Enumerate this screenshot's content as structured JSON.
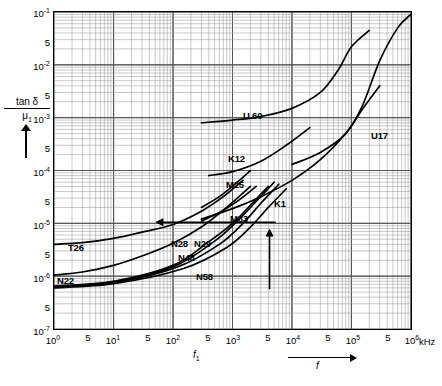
{
  "chart_data": {
    "type": "line",
    "title": "",
    "xlabel": "f",
    "xunit": "kHz",
    "ylabel": "tan δ / μ1",
    "x_axis": {
      "scale": "log",
      "min": 1,
      "max": 1000000,
      "decades": 6,
      "tick_labels": [
        "10",
        "5",
        "10",
        "5",
        "10",
        "5",
        "10",
        "5",
        "10",
        "5",
        "10",
        "5",
        "10"
      ],
      "major_labels": [
        "10^0",
        "10^1",
        "10^2",
        "10^3",
        "10^4",
        "10^5",
        "10^6"
      ],
      "minor_label": "5",
      "grid": true
    },
    "y_axis": {
      "scale": "log",
      "min": 1e-07,
      "max": 0.1,
      "decades": 6,
      "major_labels": [
        "10^-1",
        "10^-2",
        "10^-3",
        "10^-4",
        "10^-5",
        "10^-6",
        "10^-7"
      ],
      "minor_label": "5",
      "grid": true
    },
    "legend_position": "inline-annotations",
    "series": [
      {
        "name": "U60",
        "label": "U 60",
        "points": [
          [
            300,
            0.0008
          ],
          [
            1000,
            0.0009
          ],
          [
            3000,
            0.00105
          ],
          [
            10000,
            0.0015
          ],
          [
            30000,
            0.003
          ],
          [
            60000,
            0.008
          ],
          [
            100000,
            0.022
          ],
          [
            200000,
            0.045
          ]
        ]
      },
      {
        "name": "U17",
        "label": "U17",
        "points": [
          [
            10000,
            0.00013
          ],
          [
            30000,
            0.00022
          ],
          [
            80000,
            0.0005
          ],
          [
            150000,
            0.0016
          ],
          [
            300000,
            0.012
          ],
          [
            600000,
            0.05
          ],
          [
            1000000,
            0.09
          ]
        ]
      },
      {
        "name": "K12",
        "label": "K12",
        "points": [
          [
            400,
            8e-05
          ],
          [
            1000,
            9.5e-05
          ],
          [
            3000,
            0.00015
          ],
          [
            8000,
            0.0003
          ],
          [
            20000,
            0.00065
          ]
        ]
      },
      {
        "name": "M25",
        "label": "M25",
        "points": [
          [
            300,
            2e-05
          ],
          [
            600,
            3.2e-05
          ],
          [
            1200,
            6e-05
          ],
          [
            2000,
            0.0001
          ]
        ]
      },
      {
        "name": "K1",
        "label": "K1",
        "points": [
          [
            300,
            1.2e-05
          ],
          [
            1000,
            1.9e-05
          ],
          [
            3000,
            3.2e-05
          ],
          [
            10000,
            6.5e-05
          ],
          [
            30000,
            0.00016
          ],
          [
            80000,
            0.0005
          ],
          [
            150000,
            0.0014
          ],
          [
            300000,
            0.004
          ]
        ]
      },
      {
        "name": "M33",
        "label": "M33",
        "points": [
          [
            300,
            1.1e-05
          ],
          [
            600,
            1.6e-05
          ],
          [
            1200,
            2.6e-05
          ],
          [
            2500,
            5e-05
          ]
        ]
      },
      {
        "name": "T26",
        "label": "T26",
        "points": [
          [
            1,
            4e-06
          ],
          [
            3,
            4.3e-06
          ],
          [
            10,
            5.2e-06
          ],
          [
            30,
            6.8e-06
          ],
          [
            100,
            9.5e-06
          ],
          [
            300,
            1.7e-05
          ],
          [
            700,
            3.2e-05
          ],
          [
            1500,
            6.5e-05
          ]
        ]
      },
      {
        "name": "N22",
        "label": "N22",
        "points": [
          [
            1,
            1.05e-06
          ],
          [
            3,
            1.2e-06
          ],
          [
            10,
            1.6e-06
          ],
          [
            30,
            2.4e-06
          ],
          [
            100,
            4.2e-06
          ],
          [
            300,
            8.5e-06
          ],
          [
            800,
            2e-05
          ],
          [
            2000,
            5e-05
          ]
        ]
      },
      {
        "name": "N28",
        "label": "N28",
        "points": [
          [
            1,
            6.5e-07
          ],
          [
            10,
            8e-07
          ],
          [
            100,
            1.6e-06
          ],
          [
            400,
            4.5e-06
          ],
          [
            1000,
            1e-05
          ],
          [
            2000,
            2.2e-05
          ],
          [
            4000,
            5e-05
          ]
        ]
      },
      {
        "name": "N29",
        "label": "N29",
        "points": [
          [
            1,
            6.3e-07
          ],
          [
            10,
            7.8e-07
          ],
          [
            100,
            1.5e-06
          ],
          [
            500,
            4.6e-06
          ],
          [
            1200,
            1.1e-05
          ],
          [
            2500,
            2.6e-05
          ],
          [
            5000,
            6e-05
          ]
        ]
      },
      {
        "name": "N48",
        "label": "N48",
        "points": [
          [
            1,
            6.2e-07
          ],
          [
            10,
            7.5e-07
          ],
          [
            120,
            1.5e-06
          ],
          [
            600,
            4e-06
          ],
          [
            1500,
            1e-05
          ],
          [
            3000,
            2.4e-05
          ],
          [
            6000,
            5.5e-05
          ]
        ]
      },
      {
        "name": "N58",
        "label": "N58",
        "points": [
          [
            1,
            6e-07
          ],
          [
            10,
            7.2e-07
          ],
          [
            150,
            1.4e-06
          ],
          [
            800,
            3.5e-06
          ],
          [
            2000,
            8.5e-06
          ],
          [
            4000,
            2e-05
          ],
          [
            8000,
            4.5e-05
          ]
        ]
      }
    ],
    "annotations": [
      {
        "type": "arrow",
        "direction": "left",
        "name": "left-pointing-arrow"
      },
      {
        "type": "arrow",
        "direction": "up",
        "name": "up-pointing-arrow"
      }
    ]
  },
  "axis": {
    "y_title_num": "tan δ",
    "y_title_den": "μ1",
    "x_f1": "f",
    "x_f1_sub": "1",
    "x_var": "f",
    "x_unit": "kHz",
    "minor": "5",
    "y_ticks": [
      {
        "mant": "10",
        "exp": "-1"
      },
      {
        "mant": "10",
        "exp": "-2"
      },
      {
        "mant": "10",
        "exp": "-3"
      },
      {
        "mant": "10",
        "exp": "-4"
      },
      {
        "mant": "10",
        "exp": "-5"
      },
      {
        "mant": "10",
        "exp": "-6"
      },
      {
        "mant": "10",
        "exp": "-7"
      }
    ],
    "x_ticks": [
      {
        "mant": "10",
        "exp": "0"
      },
      {
        "mant": "10",
        "exp": "1"
      },
      {
        "mant": "10",
        "exp": "2"
      },
      {
        "mant": "10",
        "exp": "3"
      },
      {
        "mant": "10",
        "exp": "4"
      },
      {
        "mant": "10",
        "exp": "5"
      },
      {
        "mant": "10",
        "exp": "6"
      }
    ]
  },
  "labels": {
    "u60": "U 60",
    "u17": "U17",
    "k12": "K12",
    "m25": "M25",
    "k1": "K1",
    "m33": "M33",
    "t26": "T26",
    "n22": "N22",
    "n28": "N28",
    "n29": "N29",
    "n48": "N48",
    "n58": "N58"
  },
  "colors": {
    "curve": "#000000",
    "grid_major": "#555555",
    "grid_minor": "#9a9a9a",
    "frame": "#000000",
    "background": "#ffffff"
  }
}
